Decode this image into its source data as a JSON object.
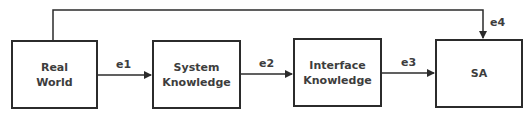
{
  "diagram": {
    "nodes": [
      {
        "id": "real-world",
        "lines": [
          "Real",
          "World"
        ]
      },
      {
        "id": "system-knowledge",
        "lines": [
          "System",
          "Knowledge"
        ]
      },
      {
        "id": "interface-knowledge",
        "lines": [
          "Interface",
          "Knowledge"
        ]
      },
      {
        "id": "sa",
        "lines": [
          "SA"
        ]
      }
    ],
    "edges": [
      {
        "id": "e1",
        "label": "e1",
        "from": "real-world",
        "to": "system-knowledge"
      },
      {
        "id": "e2",
        "label": "e2",
        "from": "system-knowledge",
        "to": "interface-knowledge"
      },
      {
        "id": "e3",
        "label": "e3",
        "from": "interface-knowledge",
        "to": "sa"
      },
      {
        "id": "e4",
        "label": "e4",
        "from": "real-world",
        "to": "sa"
      }
    ],
    "colors": {
      "stroke": "#2b2b2b",
      "text": "#3d3d3d",
      "background": "#ffffff"
    }
  }
}
